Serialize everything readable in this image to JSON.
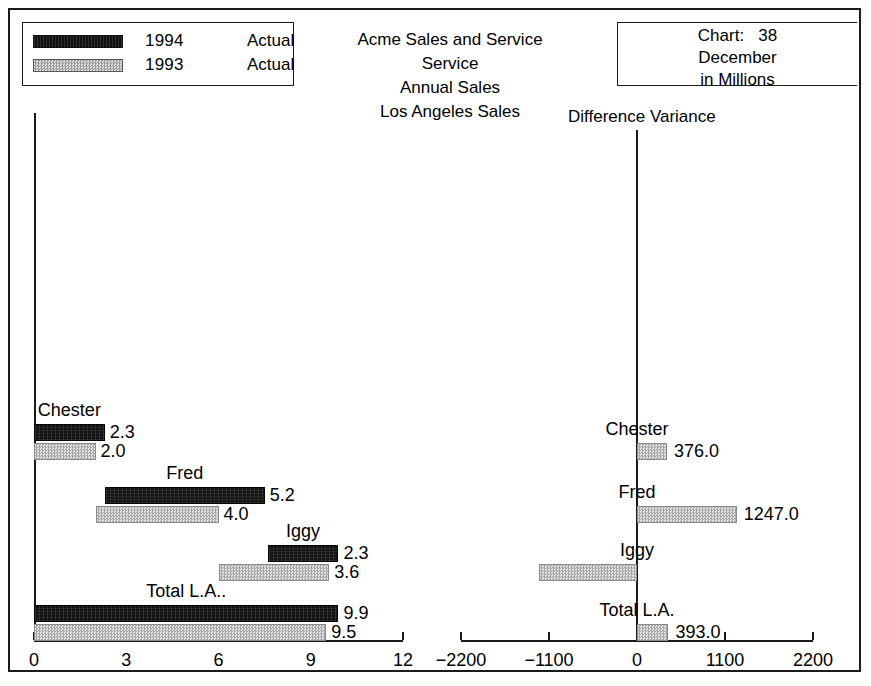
{
  "legend": {
    "rows": [
      {
        "swatch": "black-swatch",
        "year": "1994",
        "kind": "Actual"
      },
      {
        "swatch": "gray-swatch",
        "year": "1993",
        "kind": "Actual"
      }
    ]
  },
  "title": {
    "line1": "Acme Sales and Service",
    "line2": "Service",
    "line3": "Annual Sales",
    "line4": "Los Angeles Sales"
  },
  "chart_info": {
    "chart_number": "Chart:   38",
    "period": "December",
    "units": "in Millions"
  },
  "right_panel_title": "Difference Variance",
  "chart_data": [
    {
      "type": "bar",
      "subtype": "cascade",
      "title": "Los Angeles Sales",
      "xlabel": "",
      "ylabel": "",
      "xlim": [
        0,
        12
      ],
      "xticks": [
        0,
        3,
        6,
        9,
        12
      ],
      "xtick_labels": [
        "0",
        "3",
        "6",
        "9",
        "12"
      ],
      "grid": false,
      "legend_position": "top-left",
      "categories": [
        "Chester",
        "Fred",
        "Iggy",
        "Total L.A.."
      ],
      "series": [
        {
          "name": "1994 Actual",
          "color": "#141414",
          "bars": [
            {
              "category": "Chester",
              "start": 0.0,
              "end": 2.3,
              "value": 2.3,
              "label": "2.3"
            },
            {
              "category": "Fred",
              "start": 2.3,
              "end": 7.5,
              "value": 5.2,
              "label": "5.2"
            },
            {
              "category": "Iggy",
              "start": 7.6,
              "end": 9.9,
              "value": 2.3,
              "label": "2.3"
            },
            {
              "category": "Total L.A..",
              "start": 0.0,
              "end": 9.9,
              "value": 9.9,
              "label": "9.9"
            }
          ]
        },
        {
          "name": "1993 Actual",
          "color": "#cfcfcf",
          "bars": [
            {
              "category": "Chester",
              "start": 0.0,
              "end": 2.0,
              "value": 2.0,
              "label": "2.0"
            },
            {
              "category": "Fred",
              "start": 2.0,
              "end": 6.0,
              "value": 4.0,
              "label": "4.0"
            },
            {
              "category": "Iggy",
              "start": 6.0,
              "end": 9.6,
              "value": 3.6,
              "label": "3.6"
            },
            {
              "category": "Total L.A..",
              "start": 0.0,
              "end": 9.5,
              "value": 9.5,
              "label": "9.5"
            }
          ]
        }
      ]
    },
    {
      "type": "bar",
      "subtype": "diverging",
      "title": "Difference Variance",
      "xlabel": "",
      "ylabel": "",
      "xlim": [
        -2200,
        2200
      ],
      "xticks": [
        -2200,
        -1100,
        0,
        1100,
        2200
      ],
      "xtick_labels": [
        "−2200",
        "−1100",
        "0",
        "1100",
        "2200"
      ],
      "grid": false,
      "legend_position": "none",
      "categories": [
        "Chester",
        "Fred",
        "Iggy",
        "Total L.A."
      ],
      "values": [
        376.0,
        1247.0,
        -1230.0,
        393.0
      ],
      "value_labels": [
        "376.0",
        "1247.0",
        "(1230.0)",
        "393.0"
      ]
    }
  ]
}
